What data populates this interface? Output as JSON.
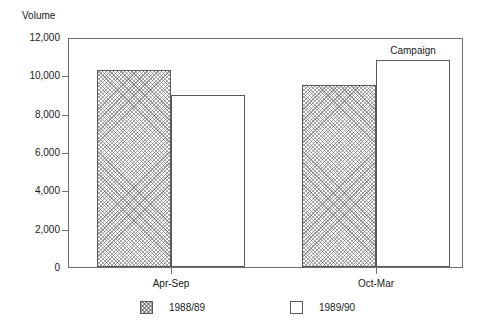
{
  "chart_data": {
    "type": "bar",
    "title": "",
    "xlabel": "",
    "ylabel": "Volume",
    "ylim": [
      0,
      12000
    ],
    "ytick_labels": [
      "12,000",
      "10,000",
      "8,000",
      "6,000",
      "4,000",
      "2,000",
      "0"
    ],
    "ytick_values": [
      12000,
      10000,
      8000,
      6000,
      4000,
      2000,
      0
    ],
    "grid": false,
    "legend_position": "bottom",
    "categories": [
      "Apr-Sep",
      "Oct-Mar"
    ],
    "series": [
      {
        "name": "1988/89",
        "fill": "crosshatch",
        "values": [
          10300,
          9500
        ]
      },
      {
        "name": "1989/90",
        "fill": "white",
        "values": [
          9000,
          10800
        ]
      }
    ],
    "annotations": [
      {
        "text": "Campaign",
        "target_category": "Oct-Mar",
        "target_series": "1989/90"
      }
    ]
  },
  "axis": {
    "y_title": "Volume",
    "ticks": [
      {
        "label": "12,000"
      },
      {
        "label": "10,000"
      },
      {
        "label": "8,000"
      },
      {
        "label": "6,000"
      },
      {
        "label": "4,000"
      },
      {
        "label": "2,000"
      },
      {
        "label": "0"
      }
    ],
    "x_labels": [
      "Apr-Sep",
      "Oct-Mar"
    ]
  },
  "annotation": {
    "campaign": "Campaign"
  },
  "legend": {
    "items": [
      {
        "label": "1988/89",
        "fill": "crosshatch"
      },
      {
        "label": "1989/90",
        "fill": "white"
      }
    ]
  }
}
